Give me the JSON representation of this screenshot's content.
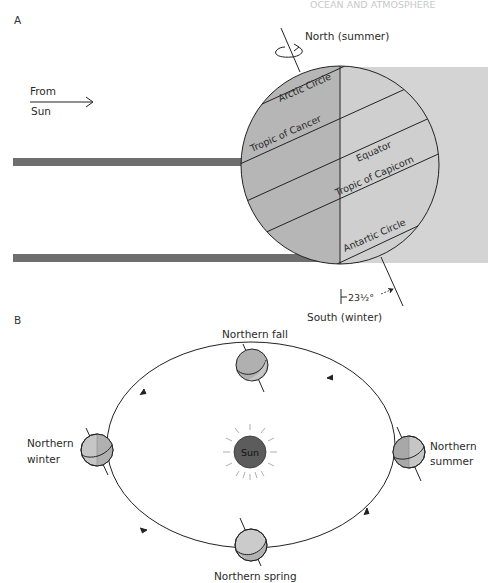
{
  "header": {
    "running_head": "OCEAN AND ATMOSPHERE"
  },
  "panel_a": {
    "label": "A",
    "from_sun_line1": "From",
    "from_sun_line2": "Sun",
    "north_label": "North (summer)",
    "south_label": "South (winter)",
    "tilt_label": "23½°",
    "circles": {
      "arctic": "Arctic Circle",
      "cancer": "Tropic of Cancer",
      "equator": "Equator",
      "capricorn": "Tropic of Capicorn",
      "antarctic": "Antartic Circle"
    },
    "colors": {
      "sunlit": "#b4b4b4",
      "dark": "#d0d0d0",
      "rays": "#6e6e6e"
    }
  },
  "panel_b": {
    "label": "B",
    "sun_label": "Sun",
    "seasons": {
      "fall": "Northern fall",
      "winter_line1": "Northern",
      "winter_line2": "winter",
      "summer_line1": "Northern",
      "summer_line2": "summer",
      "spring": "Northern spring"
    },
    "colors": {
      "sun": "#5a5a5a",
      "earth": "#b8b8b8",
      "earth_light": "#d6d6d6"
    }
  }
}
